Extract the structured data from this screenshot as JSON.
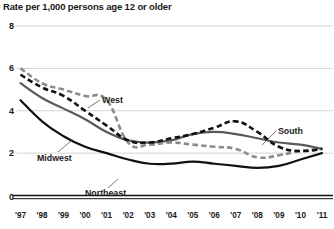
{
  "chart": {
    "title": "Rate per 1,000 persons age 12 or older"
  },
  "chart_data": {
    "type": "line",
    "title": "Rate per 1,000 persons age 12 or older",
    "xlabel": "",
    "ylabel": "Rate per 1,000 persons age 12 or older",
    "x": [
      "'97",
      "'98",
      "'99",
      "'00",
      "'01",
      "'02",
      "'03",
      "'04",
      "'05",
      "'06",
      "'07",
      "'08",
      "'09",
      "'10",
      "'11"
    ],
    "xlim": [
      "'97",
      "'11"
    ],
    "ylim": [
      0,
      8
    ],
    "yticks": [
      0,
      2,
      4,
      6,
      8
    ],
    "ytick_labels": [
      "0",
      "2",
      "4",
      "6",
      "8"
    ],
    "grid": "horizontal",
    "legend": "inline-annotations",
    "series": [
      {
        "name": "West",
        "style": "dashed",
        "color": "#8c8c8c",
        "label_x": 102,
        "label_y": 100,
        "values": [
          6.0,
          5.3,
          5.0,
          4.7,
          4.5,
          2.5,
          2.4,
          2.5,
          2.4,
          2.3,
          2.2,
          1.8,
          1.9,
          2.1,
          2.2
        ]
      },
      {
        "name": "South",
        "style": "dashed",
        "color": "#111111",
        "label_x": 278,
        "label_y": 131,
        "values": [
          5.7,
          5.1,
          4.7,
          4.0,
          3.3,
          2.6,
          2.5,
          2.7,
          2.9,
          3.2,
          3.5,
          3.0,
          2.3,
          2.1,
          2.2
        ]
      },
      {
        "name": "Midwest",
        "style": "solid",
        "color": "#5a5a5a",
        "label_x": 37,
        "label_y": 158,
        "values": [
          5.3,
          4.6,
          4.1,
          3.6,
          3.0,
          2.6,
          2.5,
          2.6,
          2.9,
          3.0,
          2.9,
          2.7,
          2.5,
          2.4,
          2.2
        ]
      },
      {
        "name": "Northeast",
        "style": "solid",
        "color": "#111111",
        "label_x": 85,
        "label_y": 193,
        "values": [
          4.5,
          3.5,
          2.8,
          2.3,
          2.0,
          1.7,
          1.5,
          1.5,
          1.6,
          1.5,
          1.4,
          1.3,
          1.4,
          1.7,
          2.0
        ]
      }
    ]
  },
  "axes": {
    "y_ticks": [
      {
        "label": "8",
        "value": 8
      },
      {
        "label": "6",
        "value": 6
      },
      {
        "label": "4",
        "value": 4
      },
      {
        "label": "2",
        "value": 2
      },
      {
        "label": "0",
        "value": 0
      }
    ],
    "x_ticks": [
      {
        "label": "'97"
      },
      {
        "label": "'98"
      },
      {
        "label": "'99"
      },
      {
        "label": "'00"
      },
      {
        "label": "'01"
      },
      {
        "label": "'02"
      },
      {
        "label": "'03"
      },
      {
        "label": "'04"
      },
      {
        "label": "'05"
      },
      {
        "label": "'06"
      },
      {
        "label": "'07"
      },
      {
        "label": "'08"
      },
      {
        "label": "'09"
      },
      {
        "label": "'10"
      },
      {
        "label": "'11"
      }
    ]
  },
  "colors": {
    "gridline": "#d0d0d0",
    "axis": "#111111",
    "text": "#1a1a1a"
  }
}
